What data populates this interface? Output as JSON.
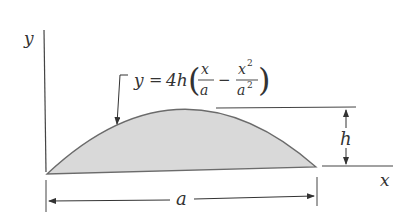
{
  "diagram": {
    "type": "parabolic area figure",
    "axes": {
      "x_label": "x",
      "y_label": "y"
    },
    "equation": {
      "lhs": "y",
      "eq": "=",
      "coef": "4h",
      "frac1_num": "x",
      "frac1_den": "a",
      "minus": "−",
      "frac2_num": "x",
      "frac2_num_exp": "2",
      "frac2_den": "a",
      "frac2_den_exp": "2",
      "full": "y = 4h(x/a − x²/a²)"
    },
    "dimensions": {
      "height_label": "h",
      "width_label": "a"
    },
    "colors": {
      "fill": "#d9d9d9",
      "stroke": "#6b6b6b",
      "text": "#333333"
    }
  }
}
